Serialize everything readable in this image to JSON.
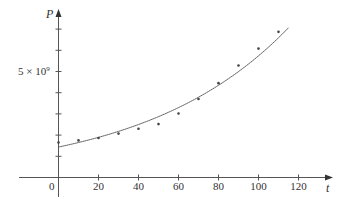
{
  "chart_data": {
    "type": "scatter",
    "title": "",
    "xlabel": "t",
    "ylabel": "P",
    "x_ticks": [
      0,
      20,
      40,
      60,
      80,
      100,
      120
    ],
    "x_tick_labels": [
      "0",
      "20",
      "40",
      "60",
      "80",
      "100",
      "120"
    ],
    "y_ticks": [
      1000000000.0,
      2000000000.0,
      3000000000.0,
      4000000000.0,
      5000000000.0,
      6000000000.0,
      7000000000.0
    ],
    "y_tick_labels": [
      "",
      "",
      "",
      "",
      "5 × 10⁹",
      "",
      ""
    ],
    "xlim": [
      -20,
      135
    ],
    "ylim": [
      -1000000000.0,
      8000000000.0
    ],
    "grid": false,
    "legend": null,
    "series": [
      {
        "name": "data",
        "type": "scatter",
        "x": [
          0,
          10,
          20,
          30,
          40,
          50,
          60,
          70,
          80,
          90,
          100,
          110
        ],
        "y": [
          1650000000.0,
          1750000000.0,
          1860000000.0,
          2070000000.0,
          2300000000.0,
          2520000000.0,
          3020000000.0,
          3700000000.0,
          4450000000.0,
          5280000000.0,
          6080000000.0,
          6870000000.0
        ]
      },
      {
        "name": "exponential model",
        "type": "line",
        "formula": "P = 1.436e9 * 1.01395^t",
        "a": 1436000000.0,
        "b": 1.01395,
        "t_range": [
          0,
          115
        ]
      }
    ]
  },
  "labels": {
    "y_axis": "P",
    "x_axis": "t",
    "origin": "0",
    "y_marker": "5 × 10",
    "y_marker_exp": "9"
  }
}
